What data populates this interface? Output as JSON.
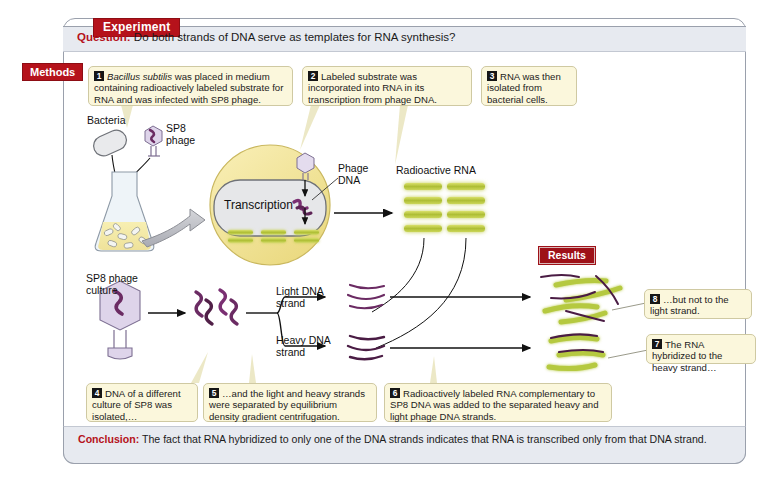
{
  "figure": {
    "experiment_badge": "Experiment",
    "methods_badge": "Methods",
    "results_badge": "Results",
    "question_label": "Question:",
    "question_text": " Do both strands of DNA serve as templates for RNA synthesis?",
    "conclusion_label": "Conclusion:",
    "conclusion_text": " The fact that RNA hybridized to only one of the DNA strands indicates that RNA is transcribed only from that DNA strand."
  },
  "steps": [
    {
      "num": "1",
      "text": " was placed in medium containing radioactively labeled substrate for RNA and was infected with SP8 phage.",
      "italic_lead": "Bacillus subtilis"
    },
    {
      "num": "2",
      "text": "Labeled substrate was incorporated into RNA in its transcription from phage DNA."
    },
    {
      "num": "3",
      "text": "RNA was then isolated from bacterial cells."
    },
    {
      "num": "4",
      "text": "DNA of a different culture of SP8 was isolated,…"
    },
    {
      "num": "5",
      "text": "…and the light and heavy strands were separated by equilibrium density gradient centrifugation."
    },
    {
      "num": "6",
      "text": "Radioactively labeled RNA complementary to SP8 DNA was added to the separated heavy and light  phage DNA strands."
    },
    {
      "num": "7",
      "text": "The RNA hybridized to the heavy strand…"
    },
    {
      "num": "8",
      "text": "…but not to the light strand."
    }
  ],
  "art_labels": {
    "bacteria": "Bacteria",
    "sp8_phage": "SP8\nphage",
    "transcription": "Transcription",
    "phage_dna": "Phage\nDNA",
    "radioactive_rna": "Radioactive RNA",
    "sp8_culture": "SP8 phage\nculture",
    "light_dna": "Light DNA\nstrand",
    "heavy_dna": "Heavy DNA\nstrand"
  },
  "colors": {
    "accent_red": "#b5121b",
    "callout_bg": "#fbf7dc",
    "callout_border": "#cfc9a2",
    "bar_bg": "#e7eaf0",
    "frame_border": "#9aa0ac",
    "cell_yellow": "#f2e7a0",
    "rna_green": "#b5c93f",
    "dna_purple": "#6b2b63",
    "phage_lilac": "#ded4ea"
  }
}
